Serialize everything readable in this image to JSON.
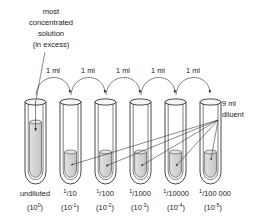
{
  "figure": {
    "title_note": "serial dilution series diagram",
    "annotations": {
      "source_label_lines": [
        "most",
        "concentrated",
        "solution",
        "(in excess)"
      ],
      "source_label": "most concentrated solution (in excess)",
      "transfer_label": "1 ml",
      "transfer_labels": [
        "1 ml",
        "1 ml",
        "1 ml",
        "1 ml",
        "1 ml"
      ],
      "diluent_label_lines": [
        "9 ml",
        "diluent"
      ],
      "diluent_label": "9 ml diluent"
    },
    "tubes": [
      {
        "name": "undiluted",
        "label": "undiluted",
        "fraction_numerator": "1",
        "fraction_denominator": "",
        "fraction": "",
        "exponent_base": "(10",
        "exponent": "0",
        "exponent_close": ")",
        "exponent_label": "(10 )",
        "filled": "full",
        "has_source_arrow": true
      },
      {
        "name": "dilution-1",
        "label": "",
        "fraction_numerator": "1",
        "fraction_denominator": "10",
        "fraction": "1/10",
        "exponent_base": "(10",
        "exponent": "-1",
        "exponent_close": ")",
        "exponent_label": "(10-1)",
        "filled": "partial",
        "has_source_arrow": false
      },
      {
        "name": "dilution-2",
        "label": "",
        "fraction_numerator": "1",
        "fraction_denominator": "100",
        "fraction": "1/100",
        "exponent_base": "(10",
        "exponent": "-2",
        "exponent_close": ")",
        "exponent_label": "(10-2)",
        "filled": "partial",
        "has_source_arrow": false
      },
      {
        "name": "dilution-3",
        "label": "",
        "fraction_numerator": "1",
        "fraction_denominator": "1000",
        "fraction": "1/1000",
        "exponent_base": "(10",
        "exponent": "-3",
        "exponent_close": ")",
        "exponent_label": "(10-3)",
        "filled": "partial",
        "has_source_arrow": false
      },
      {
        "name": "dilution-4",
        "label": "",
        "fraction_numerator": "1",
        "fraction_denominator": "10000",
        "fraction": "1/10000",
        "exponent_base": "(10",
        "exponent": "-4",
        "exponent_close": ")",
        "exponent_label": "(10-4)",
        "filled": "partial",
        "has_source_arrow": false
      },
      {
        "name": "dilution-5",
        "label": "",
        "fraction_numerator": "1",
        "fraction_denominator": "100 000",
        "fraction": "1/100 000",
        "exponent_base": "(10",
        "exponent": "-5",
        "exponent_close": ")",
        "exponent_label": "(10-5)",
        "filled": "partial",
        "has_source_arrow": false
      }
    ],
    "colors": {
      "ink": "#1a1a1a",
      "liquid": "#d6d6d6",
      "liquid_dark": "#c4c4c4",
      "glass": "#fdfdfd",
      "background": "#ffffff"
    }
  }
}
